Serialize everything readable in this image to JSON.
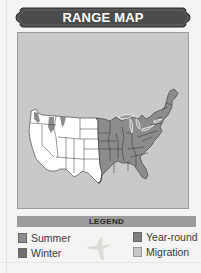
{
  "header": {
    "title": "RANGE MAP"
  },
  "map": {
    "region": "Contiguous United States",
    "background_color": "#c9c9c9",
    "land_color": "#ffffff",
    "range_color": "#8c8c8c",
    "state_line_color": "#333333",
    "lakes_outline_color": "#e8e8e8"
  },
  "legend": {
    "title": "LEGEND",
    "bar_color": "#9b9b9b",
    "items": [
      {
        "label": "Summer",
        "color": "#8d8d8d"
      },
      {
        "label": "Winter",
        "color": "#6f6f6f"
      },
      {
        "label": "Year-round",
        "color": "#7e7e7e"
      },
      {
        "label": "Migration",
        "color": "#c6c6c6"
      }
    ],
    "icon": "bird-silhouette-icon"
  }
}
